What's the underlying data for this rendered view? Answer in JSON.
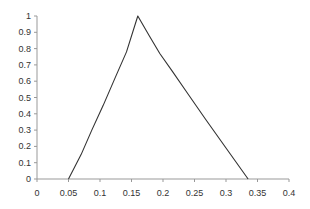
{
  "chart_data": {
    "type": "line",
    "title": "",
    "xlabel": "",
    "ylabel": "",
    "xlim": [
      0,
      0.4
    ],
    "ylim": [
      0,
      1
    ],
    "grid": false,
    "legend": "none",
    "x_ticks": [
      "0",
      "0.05",
      "0.1",
      "0.15",
      "0.2",
      "0.25",
      "0.3",
      "0.35",
      "0.4"
    ],
    "x_tick_values": [
      0,
      0.05,
      0.1,
      0.15,
      0.2,
      0.25,
      0.3,
      0.35,
      0.4
    ],
    "y_ticks": [
      "0",
      "0.1",
      "0.2",
      "0.3",
      "0.4",
      "0.5",
      "0.6",
      "0.7",
      "0.8",
      "0.9",
      "1"
    ],
    "y_tick_values": [
      0,
      0.1,
      0.2,
      0.3,
      0.4,
      0.5,
      0.6,
      0.7,
      0.8,
      0.9,
      1
    ],
    "series": [
      {
        "name": "membership",
        "color": "#333333",
        "x": [
          0.05,
          0.07,
          0.087,
          0.105,
          0.124,
          0.142,
          0.16,
          0.178,
          0.195,
          0.215,
          0.24,
          0.267,
          0.3,
          0.335
        ],
        "y": [
          0,
          0.15,
          0.3,
          0.45,
          0.62,
          0.78,
          1.0,
          0.88,
          0.77,
          0.66,
          0.52,
          0.37,
          0.19,
          0
        ]
      }
    ],
    "axis_color": "#999999"
  }
}
